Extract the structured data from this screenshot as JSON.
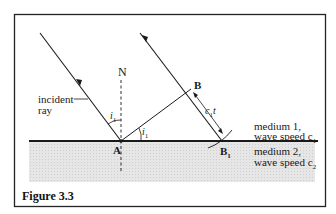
{
  "figure": {
    "caption": "Figure 3.3",
    "labels": {
      "normal": "N",
      "incident_ray_line1": "incident",
      "incident_ray_line2": "ray",
      "point_A": "A",
      "point_B": "B",
      "point_B1": "B",
      "point_B1_sub": "1",
      "angle_i1_left": "i",
      "angle_i1_left_sub": "1",
      "angle_i1_right": "i",
      "angle_i1_right_sub": "1",
      "distance_c1t": "c",
      "distance_c1t_sub": "1",
      "distance_c1t_t": "t",
      "medium1_line1": "medium 1,",
      "medium1_line2": "wave speed c",
      "medium1_sub": "1",
      "medium2_line1": "medium 2,",
      "medium2_line2": "wave speed c",
      "medium2_sub": "2"
    },
    "colors": {
      "line": "#1a1a1a",
      "medium2_fill": "#e2e2e2",
      "frame": "#222222"
    }
  }
}
